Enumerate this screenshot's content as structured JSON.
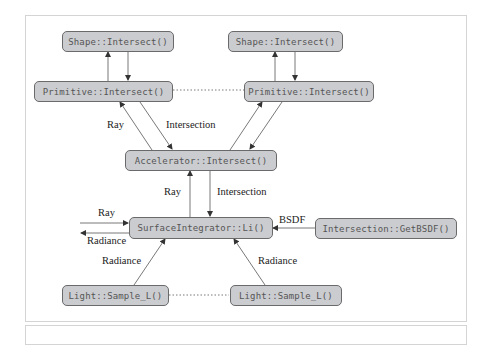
{
  "nodes": {
    "shape1": "Shape::Intersect()",
    "shape2": "Shape::Intersect()",
    "primitive1": "Primitive::Intersect()",
    "primitive2": "Primitive::Intersect()",
    "accelerator": "Accelerator::Intersect()",
    "surface_integrator": "SurfaceIntegrator::Li()",
    "get_bsdf": "Intersection::GetBSDF()",
    "light1": "Light::Sample_L()",
    "light2": "Light::Sample_L()"
  },
  "labels": {
    "prim_ray": "Ray",
    "prim_intersection": "Intersection",
    "accel_ray": "Ray",
    "accel_intersection": "Intersection",
    "in_ray": "Ray",
    "out_radiance": "Radiance",
    "bsdf": "BSDF",
    "light1_radiance": "Radiance",
    "light2_radiance": "Radiance"
  },
  "colors": {
    "node_fill": "#cbccd0",
    "node_border": "#6a6a6a",
    "edge": "#444444"
  }
}
